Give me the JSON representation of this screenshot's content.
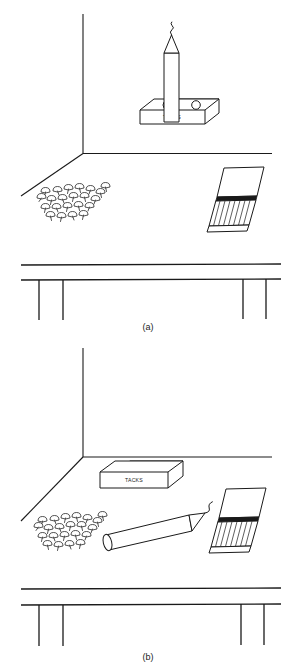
{
  "figure": {
    "stroke_color": "#1a1a1a",
    "fill_color": "#ffffff",
    "background_color": "#ffffff"
  },
  "panels": [
    {
      "id": "a",
      "caption": "(a)",
      "description": "Candle standing upright inside the open box of tacks on a table beside a wall corner, with a pile of loose tacks and a matchbook.",
      "objects": {
        "tack_box": {
          "name": "box of tacks",
          "label": "TACKS"
        },
        "candle": {
          "name": "candle",
          "state": "upright in box"
        },
        "tack_pile": {
          "name": "pile of tacks",
          "count": 0
        },
        "matchbook": {
          "name": "matchbook",
          "state": "open"
        },
        "table": {
          "name": "table",
          "legs": 4
        },
        "wall_corner": {
          "name": "wall corner"
        }
      }
    },
    {
      "id": "b",
      "caption": "(b)",
      "description": "Empty box of tacks resting on the table, candle lying on its side, pile of loose tacks, and a matchbook.",
      "objects": {
        "tack_box": {
          "name": "empty box",
          "label": "TACKS"
        },
        "candle": {
          "name": "candle",
          "state": "lying on side"
        },
        "tack_pile": {
          "name": "pile of tacks",
          "count": 0
        },
        "matchbook": {
          "name": "matchbook",
          "state": "open"
        },
        "table": {
          "name": "table",
          "legs": 4
        },
        "wall_corner": {
          "name": "wall corner"
        }
      }
    }
  ],
  "labels": {
    "caption_a": "(a)",
    "caption_b": "(b)",
    "tacks_box_a": "TACKS",
    "tacks_box_b": "TACKS"
  }
}
